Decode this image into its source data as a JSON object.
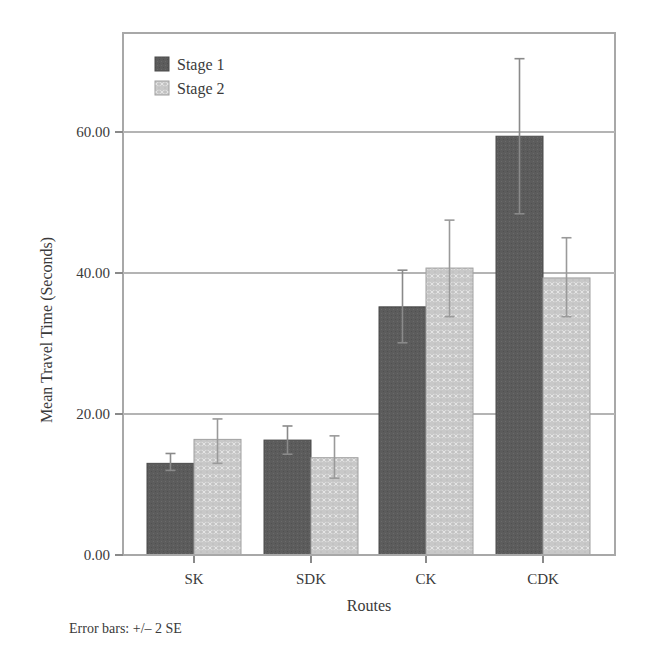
{
  "chart_data": {
    "type": "bar",
    "title": "",
    "xlabel": "Routes",
    "ylabel": "Mean Travel Time (Seconds)",
    "categories": [
      "SK",
      "SDK",
      "CK",
      "CDK"
    ],
    "series": [
      {
        "name": "Stage 1",
        "color": "#5c5c5c",
        "values": [
          13.0,
          16.3,
          35.2,
          59.4
        ],
        "error_low": [
          12.0,
          14.3,
          30.1,
          48.4
        ],
        "error_high": [
          14.4,
          18.3,
          40.4,
          70.4
        ]
      },
      {
        "name": "Stage 2",
        "color": "#c8c8c8",
        "values": [
          16.4,
          13.8,
          40.7,
          39.3
        ],
        "error_low": [
          13.0,
          10.9,
          33.8,
          33.8
        ],
        "error_high": [
          19.3,
          16.9,
          47.5,
          45.0
        ]
      }
    ],
    "yticks": [
      "0.00",
      "20.00",
      "40.00",
      "60.00"
    ],
    "ytick_values": [
      0,
      20,
      40,
      60
    ],
    "ylim": [
      0,
      74
    ],
    "grid": true,
    "legend_position": "top-left inside",
    "annotation": "Error bars: +/– 2 SE"
  },
  "footnote": "Error bars: +/– 2 SE"
}
